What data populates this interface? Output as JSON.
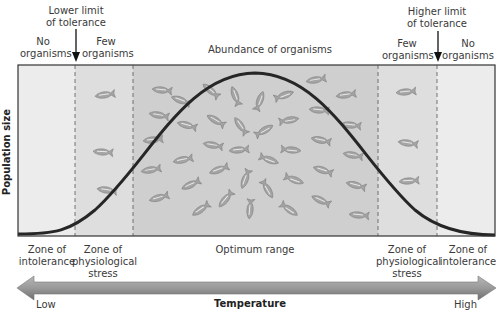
{
  "title_center": "Abundance of organisms",
  "top_labels": {
    "lower_limit": [
      "Lower limit",
      "of tolerance"
    ],
    "higher_limit": [
      "Higher limit",
      "of tolerance"
    ],
    "no_organisms_left": [
      "No",
      "organisms"
    ],
    "few_organisms_left": [
      "Few",
      "organisms"
    ],
    "few_organisms_right": [
      "Few",
      "organisms"
    ],
    "no_organisms_right": [
      "No",
      "organisms"
    ]
  },
  "y_axis_label": "Population size",
  "zones": [
    {
      "id": "intolerance-left",
      "label": [
        "Zone of",
        "intolerance"
      ],
      "fill": "#ececec"
    },
    {
      "id": "stress-left",
      "label": [
        "Zone of",
        "physiological",
        "stress"
      ],
      "fill": "#dedede"
    },
    {
      "id": "optimum",
      "label": [
        "Optimum range"
      ],
      "fill": "#cfcfcf"
    },
    {
      "id": "stress-right",
      "label": [
        "Zone of",
        "physiological",
        "stress"
      ],
      "fill": "#dedede"
    },
    {
      "id": "intolerance-right",
      "label": [
        "Zone of",
        "intolerance"
      ],
      "fill": "#ececec"
    }
  ],
  "x_axis": {
    "title": "Temperature",
    "low": "Low",
    "high": "High"
  },
  "colors": {
    "curve": "#2a2a2a",
    "arrow": "#8a8a8a",
    "fish": "#9a9a9a",
    "border": "#333333"
  }
}
